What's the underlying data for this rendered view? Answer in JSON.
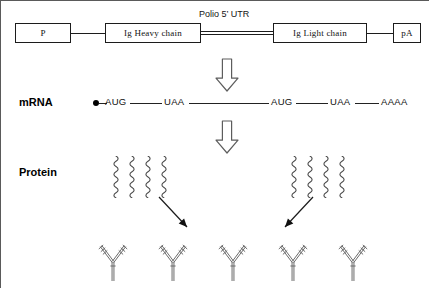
{
  "figure": {
    "background": "#ffffff",
    "line_color": "#1c1c1c",
    "squiggle_color": "#4a4a4a",
    "antibody_color": "#6b6b6b"
  },
  "construct": {
    "boxes": [
      {
        "id": "promoter",
        "label": "P",
        "x": 14,
        "y": 22,
        "w": 56,
        "h": 20
      },
      {
        "id": "heavy-chain",
        "label": "Ig  Heavy chain",
        "x": 104,
        "y": 22,
        "w": 96,
        "h": 20
      },
      {
        "id": "light-chain",
        "label": "Ig  Light chain",
        "x": 272,
        "y": 22,
        "w": 94,
        "h": 20
      },
      {
        "id": "polya",
        "label": "pA",
        "x": 392,
        "y": 22,
        "w": 28,
        "h": 20
      }
    ],
    "connectors": [
      {
        "id": "p-to-heavy",
        "x": 70,
        "y": 32,
        "w": 34
      },
      {
        "id": "light-to-polya",
        "x": 366,
        "y": 32,
        "w": 26
      }
    ],
    "utr": {
      "label": "Polio 5’ UTR",
      "label_x": 198,
      "label_y": 8,
      "line_x": 200,
      "line_y": 30,
      "line_w": 72
    }
  },
  "rows": {
    "mrna_label": "mRNA",
    "protein_label": "Protein"
  },
  "mrna": {
    "cap_x": 92,
    "cap_y": 99,
    "baseline_y": 102,
    "codons": [
      {
        "id": "aug-1",
        "text": "AUG",
        "x": 104
      },
      {
        "id": "uaa-1",
        "text": "UAA",
        "x": 163
      },
      {
        "id": "aug-2",
        "text": "AUG",
        "x": 270
      },
      {
        "id": "uaa-2",
        "text": "UAA",
        "x": 329
      },
      {
        "id": "polya-tail",
        "text": "AAAA",
        "x": 380
      }
    ],
    "segments": [
      {
        "x": 98,
        "w": 8
      },
      {
        "x": 129,
        "w": 32
      },
      {
        "x": 188,
        "w": 80
      },
      {
        "x": 295,
        "w": 32
      },
      {
        "x": 354,
        "w": 24
      }
    ]
  },
  "arrows": {
    "transcription": {
      "id": "transcription-arrow",
      "x": 215,
      "y": 58,
      "w": 22,
      "h": 32
    },
    "translation": {
      "id": "translation-arrow",
      "x": 215,
      "y": 120,
      "w": 22,
      "h": 32
    },
    "assembly": [
      {
        "id": "assembly-arrow-left",
        "x1": 158,
        "y1": 196,
        "x2": 186,
        "y2": 226
      },
      {
        "id": "assembly-arrow-right",
        "x1": 312,
        "y1": 196,
        "x2": 284,
        "y2": 226
      }
    ]
  },
  "polypeptides": {
    "heavy_group": {
      "id": "heavy-chain-polypeptides",
      "count": 4,
      "x": 110,
      "y": 155,
      "spacing": 16,
      "height": 42
    },
    "light_group": {
      "id": "light-chain-polypeptides",
      "count": 4,
      "x": 288,
      "y": 155,
      "spacing": 16,
      "height": 42
    }
  },
  "antibodies": {
    "count": 5,
    "y": 245,
    "positions": [
      112,
      172,
      232,
      292,
      352
    ],
    "scale": 1.0
  }
}
